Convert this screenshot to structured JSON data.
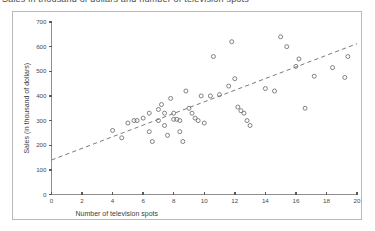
{
  "title": {
    "text": "Sales in thousand of dollars and number of television spots",
    "cropped": true
  },
  "chart_data": {
    "type": "scatter",
    "title": "",
    "xlabel": "Number of television spots",
    "ylabel": "Sales (in thousand of dollars)",
    "xlim": [
      0,
      20
    ],
    "ylim": [
      0,
      700
    ],
    "xticks": [
      0,
      2,
      4,
      6,
      8,
      10,
      12,
      14,
      16,
      18,
      20
    ],
    "yticks": [
      0,
      100,
      200,
      300,
      400,
      500,
      600,
      700
    ],
    "grid": false,
    "legend": null,
    "marker": "open-circle",
    "points": [
      [
        4.0,
        260
      ],
      [
        4.6,
        230
      ],
      [
        5.0,
        290
      ],
      [
        5.4,
        300
      ],
      [
        5.6,
        300
      ],
      [
        6.0,
        310
      ],
      [
        6.4,
        330
      ],
      [
        6.4,
        255
      ],
      [
        6.6,
        215
      ],
      [
        7.0,
        345
      ],
      [
        7.0,
        300
      ],
      [
        7.2,
        365
      ],
      [
        7.4,
        330
      ],
      [
        7.4,
        280
      ],
      [
        7.6,
        240
      ],
      [
        7.8,
        390
      ],
      [
        8.0,
        330
      ],
      [
        8.0,
        305
      ],
      [
        8.2,
        305
      ],
      [
        8.4,
        300
      ],
      [
        8.4,
        255
      ],
      [
        8.6,
        215
      ],
      [
        8.8,
        420
      ],
      [
        9.0,
        350
      ],
      [
        9.2,
        330
      ],
      [
        9.4,
        310
      ],
      [
        9.6,
        300
      ],
      [
        9.8,
        400
      ],
      [
        10.0,
        290
      ],
      [
        10.4,
        400
      ],
      [
        10.6,
        560
      ],
      [
        11.0,
        405
      ],
      [
        11.6,
        440
      ],
      [
        11.8,
        620
      ],
      [
        12.0,
        470
      ],
      [
        12.2,
        355
      ],
      [
        12.4,
        340
      ],
      [
        12.6,
        330
      ],
      [
        12.8,
        300
      ],
      [
        13.0,
        280
      ],
      [
        14.0,
        430
      ],
      [
        14.6,
        420
      ],
      [
        15.0,
        640
      ],
      [
        15.4,
        600
      ],
      [
        16.0,
        520
      ],
      [
        16.2,
        550
      ],
      [
        16.6,
        350
      ],
      [
        17.2,
        480
      ],
      [
        18.4,
        515
      ],
      [
        19.2,
        475
      ],
      [
        19.4,
        560
      ]
    ],
    "trendline": {
      "style": "dashed",
      "x": [
        0,
        20
      ],
      "y": [
        140,
        612
      ]
    }
  },
  "axes": {
    "x_tick_labels": [
      "0",
      "2",
      "4",
      "6",
      "8",
      "10",
      "12",
      "14",
      "16",
      "18",
      "20"
    ],
    "y_tick_labels": [
      "0",
      "100",
      "200",
      "300",
      "400",
      "500",
      "600",
      "700"
    ]
  }
}
